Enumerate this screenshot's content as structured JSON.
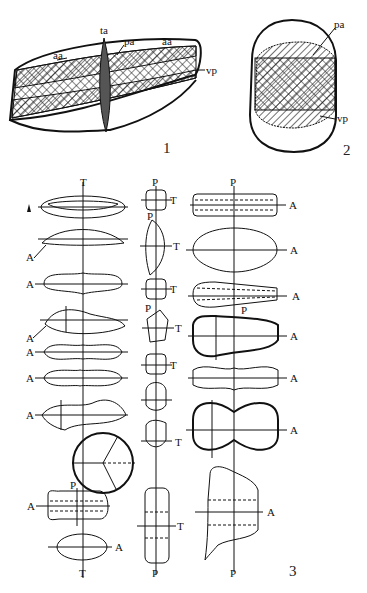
{
  "figure": {
    "panels": [
      {
        "id": "1",
        "number_label": "1",
        "labels": {
          "ta": "ta",
          "pa": "pa",
          "aa_left": "aa",
          "aa_right": "aa",
          "vp": "vp"
        }
      },
      {
        "id": "2",
        "number_label": "2",
        "labels": {
          "pa": "pa",
          "vp": "vp"
        }
      },
      {
        "id": "3",
        "number_label": "3",
        "axis_labels": {
          "T": "T",
          "A": "A",
          "P": "P"
        },
        "column_left": {
          "top_label": "T",
          "bottom_label": "T",
          "row_labels": [
            "A",
            "A",
            "A",
            "A",
            "A",
            "A",
            "A"
          ]
        },
        "column_middle": {
          "top_label": "P",
          "bottom_label": "P",
          "side_label": "T",
          "inner_label": "P"
        },
        "column_right": {
          "top_label": "P",
          "bottom_label": "P",
          "side_label": "A",
          "inner_label": "P",
          "left_label": "T"
        }
      }
    ]
  }
}
